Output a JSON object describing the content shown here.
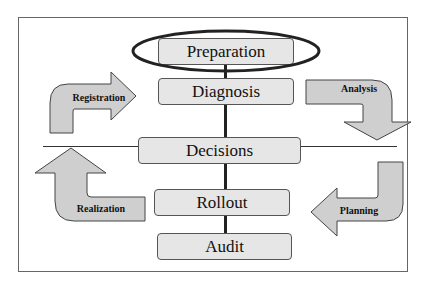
{
  "diagram": {
    "center_steps": [
      {
        "id": "preparation",
        "label": "Preparation",
        "highlighted": true
      },
      {
        "id": "diagnosis",
        "label": "Diagnosis"
      },
      {
        "id": "decisions",
        "label": "Decisions"
      },
      {
        "id": "rollout",
        "label": "Rollout"
      },
      {
        "id": "audit",
        "label": "Audit"
      }
    ],
    "cycle_arrows": [
      {
        "id": "registration",
        "label": "Registration",
        "position": "top-left",
        "direction": "up-then-right"
      },
      {
        "id": "analysis",
        "label": "Analysis",
        "position": "top-right",
        "direction": "right-then-down"
      },
      {
        "id": "planning",
        "label": "Planning",
        "position": "bottom-right",
        "direction": "down-then-left"
      },
      {
        "id": "realization",
        "label": "Realization",
        "position": "bottom-left",
        "direction": "left-then-up"
      }
    ],
    "colors": {
      "box_fill": "#e6e6e6",
      "arrow_fill": "#cfcfcf",
      "outline": "#555555",
      "highlight_ellipse": "#222222"
    }
  }
}
